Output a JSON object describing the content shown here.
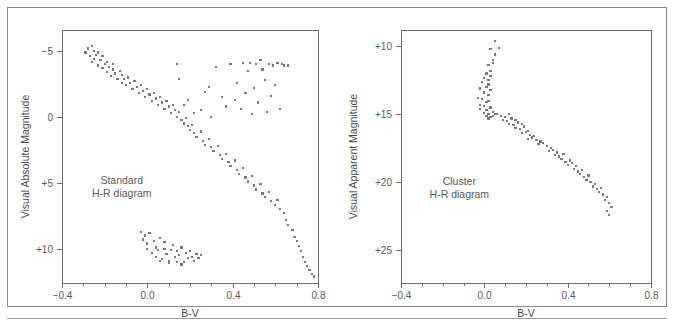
{
  "figure": {
    "background_color": "#ffffff",
    "frame_color": "#8b8b8b",
    "point_color": "#7a7a7a",
    "axis_color": "#6e6e6e",
    "text_color": "#5a5a5a"
  },
  "panels": {
    "left": {
      "annotation_line1": "Standard",
      "annotation_line2": "H-R diagram",
      "xlabel": "B-V",
      "ylabel": "Visual Absolute Magnitude",
      "xticklabels": [
        "−0.4",
        "0.0",
        "0.4",
        "0.8"
      ],
      "yticklabels": [
        "−5",
        "0",
        "+5",
        "+10"
      ]
    },
    "right": {
      "annotation_line1": "Cluster",
      "annotation_line2": "H-R diagram",
      "xlabel": "B-V",
      "ylabel": "Visual Apparent Magnitude",
      "xticklabels": [
        "−0.4",
        "0.0",
        "0.4",
        "0.8"
      ],
      "yticklabels": [
        "+10",
        "+15",
        "+20",
        "+25"
      ]
    }
  },
  "chart_data": [
    {
      "type": "scatter",
      "id": "standard-hr-diagram",
      "title": "Standard H-R diagram",
      "xlabel": "B-V",
      "ylabel": "Visual Absolute Magnitude",
      "xlim": [
        -0.4,
        0.8
      ],
      "ylim": [
        -6.6,
        12.6
      ],
      "y_inverted": true,
      "xticks": [
        -0.4,
        0.0,
        0.4,
        0.8
      ],
      "xticklabels": [
        "-0.4",
        "0.0",
        "0.4",
        "0.8"
      ],
      "yticks": [
        -5,
        0,
        5,
        10
      ],
      "yticklabels": [
        "-5",
        "0",
        "+5",
        "+10"
      ],
      "grid": false,
      "legend": false,
      "annotations": [
        {
          "text": "Standard H-R diagram",
          "x": -0.12,
          "y": 5.1
        }
      ],
      "series": [
        {
          "name": "main sequence",
          "x": [
            -0.29,
            -0.28,
            -0.27,
            -0.26,
            -0.26,
            -0.25,
            -0.25,
            -0.24,
            -0.23,
            -0.23,
            -0.22,
            -0.21,
            -0.21,
            -0.2,
            -0.19,
            -0.19,
            -0.18,
            -0.17,
            -0.16,
            -0.16,
            -0.15,
            -0.14,
            -0.13,
            -0.12,
            -0.12,
            -0.11,
            -0.1,
            -0.09,
            -0.08,
            -0.07,
            -0.06,
            -0.05,
            -0.04,
            -0.03,
            -0.02,
            -0.01,
            0.0,
            0.01,
            0.02,
            0.03,
            0.04,
            0.05,
            0.06,
            0.07,
            0.08,
            0.09,
            0.1,
            0.11,
            0.12,
            0.13,
            0.14,
            0.15,
            0.16,
            0.17,
            0.18,
            0.19,
            0.2,
            0.21,
            0.22,
            0.23,
            0.25,
            0.26,
            0.27,
            0.29,
            0.3,
            0.31,
            0.33,
            0.34,
            0.35,
            0.37,
            0.38,
            0.39,
            0.41,
            0.42,
            0.43,
            0.45,
            0.46,
            0.47,
            0.49,
            0.5,
            0.51,
            0.53,
            0.54,
            0.55,
            0.57,
            0.58,
            0.6,
            0.61,
            0.62,
            0.64,
            0.65,
            0.66,
            0.68,
            0.69,
            0.7,
            0.71,
            0.72,
            0.73,
            0.74,
            0.75,
            0.76,
            0.77,
            0.78
          ],
          "y": [
            -4.9,
            -5.2,
            -4.6,
            -5.4,
            -4.2,
            -5.0,
            -4.4,
            -4.7,
            -3.9,
            -4.9,
            -4.3,
            -3.7,
            -4.6,
            -4.0,
            -3.4,
            -4.2,
            -3.8,
            -3.1,
            -3.6,
            -4.0,
            -3.3,
            -2.9,
            -3.5,
            -2.6,
            -3.2,
            -2.9,
            -2.4,
            -3.0,
            -2.6,
            -2.1,
            -2.7,
            -2.3,
            -1.8,
            -2.4,
            -2.0,
            -1.5,
            -2.1,
            -1.7,
            -1.2,
            -1.8,
            -1.4,
            -0.9,
            -1.5,
            -1.1,
            -0.6,
            -1.2,
            -0.8,
            -0.3,
            -0.9,
            -0.5,
            0.0,
            -0.4,
            0.2,
            0.5,
            0.1,
            0.7,
            1.0,
            0.6,
            1.2,
            1.5,
            1.1,
            1.8,
            2.1,
            1.7,
            2.3,
            2.6,
            2.2,
            2.9,
            3.2,
            2.8,
            3.4,
            3.7,
            3.3,
            4.0,
            4.3,
            3.9,
            4.6,
            4.9,
            4.5,
            5.2,
            5.5,
            5.1,
            5.8,
            6.1,
            5.7,
            6.4,
            6.7,
            6.3,
            7.0,
            7.3,
            7.8,
            8.2,
            8.6,
            9.1,
            9.4,
            9.8,
            10.2,
            10.6,
            11.0,
            11.3,
            11.6,
            11.9,
            12.1
          ]
        },
        {
          "name": "giant branch",
          "x": [
            0.14,
            0.15,
            0.17,
            0.19,
            0.22,
            0.25,
            0.27,
            0.29,
            0.3,
            0.32,
            0.35,
            0.37,
            0.39,
            0.41,
            0.42,
            0.44,
            0.46,
            0.47,
            0.49,
            0.5,
            0.51,
            0.52,
            0.54,
            0.55,
            0.56,
            0.58,
            0.59,
            0.6,
            0.62,
            0.64,
            0.66,
            0.45,
            0.48,
            0.53,
            0.57,
            0.61,
            0.63
          ],
          "y": [
            -4.0,
            -2.9,
            -0.9,
            -1.3,
            -0.3,
            -0.5,
            -1.9,
            -2.3,
            0.0,
            -3.8,
            -1.5,
            -0.8,
            -4.0,
            -1.3,
            -2.6,
            -0.6,
            -1.8,
            -3.5,
            -0.2,
            -2.2,
            -4.0,
            -1.1,
            -3.6,
            -2.8,
            -0.4,
            -1.6,
            -3.9,
            -2.4,
            -0.6,
            -3.9,
            -3.9,
            -4.1,
            -4.1,
            -4.3,
            -4.0,
            -4.1,
            -4.0
          ]
        },
        {
          "name": "white dwarfs",
          "x": [
            -0.03,
            -0.02,
            -0.01,
            0.0,
            0.0,
            0.01,
            0.02,
            0.03,
            0.04,
            0.04,
            0.05,
            0.06,
            0.07,
            0.08,
            0.08,
            0.09,
            0.1,
            0.11,
            0.12,
            0.13,
            0.14,
            0.14,
            0.15,
            0.16,
            0.17,
            0.18,
            0.19,
            0.2,
            0.21,
            0.22,
            0.23,
            0.24,
            0.25,
            0.1,
            0.06,
            0.16
          ],
          "y": [
            8.7,
            9.3,
            9.0,
            10.0,
            9.6,
            8.8,
            10.3,
            9.4,
            10.6,
            9.9,
            10.1,
            9.2,
            10.8,
            10.0,
            9.5,
            10.4,
            10.9,
            10.1,
            9.7,
            10.6,
            11.0,
            10.2,
            10.5,
            9.9,
            11.0,
            10.3,
            10.7,
            10.2,
            10.6,
            10.9,
            10.4,
            10.7,
            10.5,
            11.1,
            10.9,
            11.2
          ]
        }
      ]
    },
    {
      "type": "scatter",
      "id": "cluster-hr-diagram",
      "title": "Cluster H-R diagram",
      "xlabel": "B-V",
      "ylabel": "Visual Apparent Magnitude",
      "xlim": [
        -0.4,
        0.8
      ],
      "ylim": [
        8.8,
        27.4
      ],
      "y_inverted": true,
      "xticks": [
        -0.4,
        0.0,
        0.4,
        0.8
      ],
      "xticklabels": [
        "-0.4",
        "0.0",
        "0.4",
        "0.8"
      ],
      "yticks": [
        10,
        15,
        20,
        25
      ],
      "yticklabels": [
        "+10",
        "+15",
        "+20",
        "+25"
      ],
      "grid": false,
      "legend": false,
      "annotations": [
        {
          "text": "Cluster H-R diagram",
          "x": -0.12,
          "y": 20.2
        }
      ],
      "series": [
        {
          "name": "cluster stars",
          "x": [
            0.05,
            0.07,
            0.03,
            0.05,
            0.04,
            0.02,
            0.04,
            0.03,
            0.01,
            0.03,
            0.02,
            0.0,
            0.02,
            -0.01,
            0.01,
            0.03,
            -0.02,
            0.0,
            0.02,
            -0.03,
            -0.01,
            0.01,
            -0.02,
            0.0,
            0.02,
            -0.02,
            0.01,
            0.03,
            0.0,
            0.02,
            0.04,
            0.01,
            0.03,
            0.05,
            0.02,
            0.04,
            0.06,
            0.08,
            0.1,
            0.12,
            0.09,
            0.11,
            0.13,
            0.15,
            0.12,
            0.14,
            0.16,
            0.18,
            0.15,
            0.17,
            0.19,
            0.21,
            0.18,
            0.2,
            0.22,
            0.24,
            0.21,
            0.23,
            0.25,
            0.27,
            0.26,
            0.28,
            0.3,
            0.32,
            0.31,
            0.33,
            0.35,
            0.34,
            0.36,
            0.38,
            0.37,
            0.39,
            0.41,
            0.4,
            0.42,
            0.44,
            0.43,
            0.45,
            0.47,
            0.46,
            0.48,
            0.5,
            0.49,
            0.51,
            0.53,
            0.52,
            0.54,
            0.56,
            0.55,
            0.57,
            0.59,
            0.58,
            0.6,
            0.61,
            0.59,
            0.6
          ],
          "y": [
            9.6,
            10.1,
            10.2,
            10.6,
            11.0,
            11.4,
            11.2,
            11.8,
            12.0,
            12.2,
            12.5,
            12.3,
            12.8,
            12.6,
            13.0,
            13.2,
            13.1,
            13.4,
            13.6,
            13.8,
            13.9,
            14.1,
            14.3,
            14.4,
            14.0,
            14.6,
            14.7,
            14.5,
            14.9,
            15.0,
            14.8,
            15.1,
            15.2,
            15.0,
            15.3,
            15.1,
            15.0,
            15.1,
            15.2,
            15.0,
            15.4,
            15.5,
            15.3,
            15.4,
            15.7,
            15.8,
            15.6,
            15.7,
            16.0,
            16.1,
            15.9,
            16.2,
            16.4,
            16.3,
            16.5,
            16.6,
            16.8,
            16.7,
            16.9,
            17.0,
            17.2,
            17.1,
            17.3,
            17.5,
            17.7,
            17.6,
            17.8,
            18.0,
            18.1,
            17.9,
            18.3,
            18.5,
            18.4,
            18.7,
            18.6,
            18.8,
            19.0,
            19.2,
            19.1,
            19.4,
            19.6,
            19.5,
            19.8,
            20.0,
            20.1,
            20.3,
            20.5,
            20.4,
            20.7,
            20.9,
            21.1,
            21.3,
            21.5,
            21.8,
            22.1,
            22.4
          ]
        }
      ]
    }
  ]
}
